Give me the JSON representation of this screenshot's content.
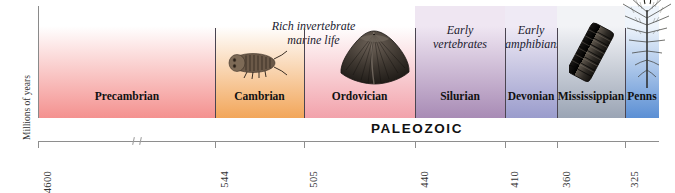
{
  "axis": {
    "caption": "Millions of years",
    "origin_label": "4600",
    "ticks": [
      {
        "label": "4600",
        "value": 4600,
        "x": 38
      },
      {
        "label": "544",
        "value": 544,
        "x": 215
      },
      {
        "label": "505",
        "value": 505,
        "x": 304
      },
      {
        "label": "440",
        "value": 440,
        "x": 415
      },
      {
        "label": "410",
        "value": 410,
        "x": 505
      },
      {
        "label": "360",
        "value": 360,
        "x": 557
      },
      {
        "label": "325",
        "value": 325,
        "x": 625
      }
    ],
    "break_symbol": true
  },
  "era_bar": {
    "label": "PALEOZOIC",
    "start_x": 215,
    "end_x": 659
  },
  "periods": [
    {
      "name": "Precambrian",
      "left": 0,
      "width": 176,
      "color_top": "#ffffff",
      "color_bottom": "#f4918f",
      "note": null,
      "fossil": null
    },
    {
      "name": "Cambrian",
      "left": 176,
      "width": 89,
      "color_top": "#ffffff",
      "color_bottom": "#f2a65a",
      "note": "Rich invertebrate\nmarine life",
      "note_span": 2,
      "fossil": "trilobite"
    },
    {
      "name": "Ordovician",
      "left": 265,
      "width": 111,
      "color_top": "#ffffff",
      "color_bottom": "#f2a2ab",
      "note": null,
      "fossil": "brachiopod"
    },
    {
      "name": "Silurian",
      "left": 376,
      "width": 90,
      "color_top": "#efe6f2",
      "color_bottom": "#a88bb5",
      "note": "Early\nvertebrates",
      "fossil": null
    },
    {
      "name": "Devonian",
      "left": 466,
      "width": 52,
      "color_top": "#efeaf5",
      "color_bottom": "#9a9ccc",
      "note": "Early\namphibians",
      "fossil": null
    },
    {
      "name": "Mississippian",
      "left": 518,
      "width": 68,
      "color_top": "#f2f3f6",
      "color_bottom": "#9aa4b4",
      "note": null,
      "fossil": "crinoid"
    },
    {
      "name": "Penns",
      "left": 586,
      "width": 34,
      "color_top": "#eef4fb",
      "color_bottom": "#5b8fd4",
      "note": null,
      "fossil": "fern"
    }
  ],
  "notes": {
    "cambrian_ordovician": "Rich invertebrate marine life",
    "silurian": "Early vertebrates",
    "devonian": "Early amphibians"
  },
  "colors": {
    "precambrian": "#f4918f",
    "cambrian": "#f2a65a",
    "ordovician": "#f2a2ab",
    "silurian": "#a88bb5",
    "devonian": "#9a9ccc",
    "mississippian": "#9aa4b4",
    "pennsylvanian": "#5b8fd4",
    "axis_line": "#8e8e8e",
    "divider": "#4a4450",
    "text": "#111111"
  }
}
